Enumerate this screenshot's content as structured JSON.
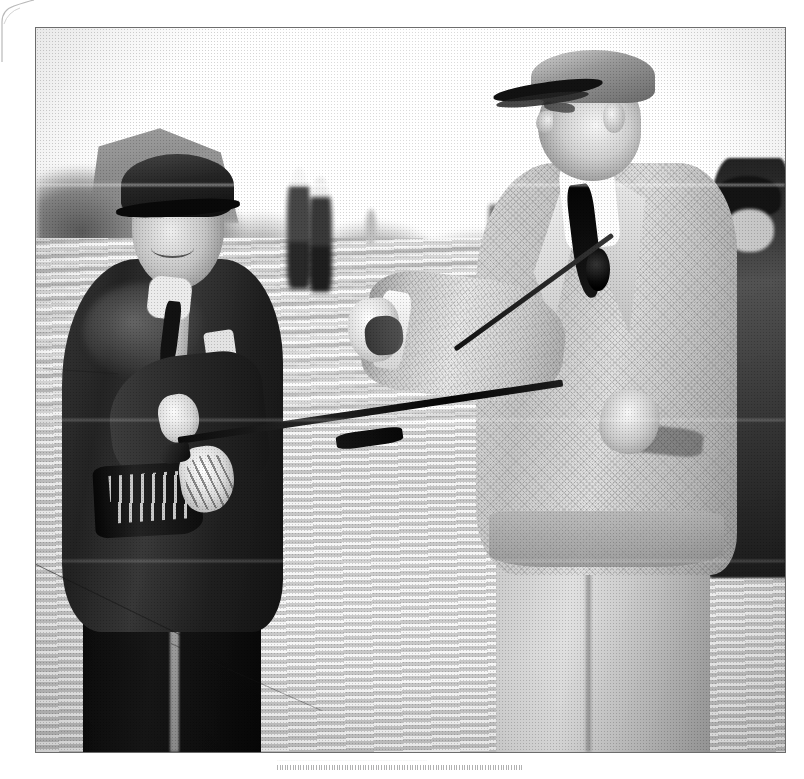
{
  "page": {
    "kind": "scanned-photograph-page",
    "background_color": "#ffffff",
    "width": 804,
    "height": 779
  },
  "photograph": {
    "title": "Two men exchanging a golf club on a golf course",
    "medium": "black-and-white press photograph",
    "border_color": "#6d6d6d",
    "frame": {
      "left": 35,
      "top": 27,
      "width": 751,
      "height": 726
    },
    "scene": {
      "setting": "open grass fairway with distant treeline and a building on the left horizon",
      "sky": "blank bright white, overexposed",
      "ground": "pale mown grass with horizontal mower bands"
    },
    "subjects": [
      {
        "id": "left-man",
        "role": "caddie",
        "description": "older smiling man in dark suit and dark flat cap, golf bag strap over shoulder, holding the head end of a golf club",
        "clothing": "dark three-piece suit, white collar, dark tie, light pocket handkerchief",
        "headwear": "dark flat cap",
        "expression": "broad smile"
      },
      {
        "id": "right-man",
        "role": "golfer",
        "description": "tall man in light tweed jacket and plus-fours, shown in profile, reaching out to hand over a golf club",
        "clothing": "light herringbone tweed jacket, white shirt, dark necktie, dark boutonniere on lapel, light trousers",
        "headwear": "light flat cap",
        "expression": "looking down, slight smile"
      }
    ],
    "background_figures": [
      {
        "id": "bg-figure-a",
        "description": "blurred spectator left of centre"
      },
      {
        "id": "bg-figure-b",
        "description": "blurred spectator left of centre, second"
      },
      {
        "id": "bg-figure-c",
        "description": "small distant figure on fairway"
      },
      {
        "id": "bg-figure-d",
        "description": "small distant figure on fairway, second"
      },
      {
        "id": "right-spectator",
        "description": "dark-clothed spectator cropped at right edge"
      }
    ],
    "objects": [
      {
        "id": "golf-club",
        "description": "wooden-shafted golf club held between both men"
      },
      {
        "id": "golf-bag",
        "description": "golf bag with club heads at the left man's hip"
      }
    ],
    "defects": [
      {
        "id": "page-curl",
        "description": "curled page corner at top left of the scan"
      },
      {
        "id": "crease-1",
        "description": "faint horizontal crease across upper photo"
      },
      {
        "id": "crease-2",
        "description": "faint horizontal crease across middle photo"
      },
      {
        "id": "crease-3",
        "description": "faint horizontal crease across lower photo"
      },
      {
        "id": "scratch-1",
        "description": "diagonal emulsion scratch lower left"
      },
      {
        "id": "scratch-3",
        "description": "diagonal emulsion scratch across lower trousers"
      }
    ]
  },
  "caption": {
    "text": "··································································································",
    "note": "faint dotted rule / illegible faded caption beneath the photograph",
    "color": "#a9a9a9"
  }
}
